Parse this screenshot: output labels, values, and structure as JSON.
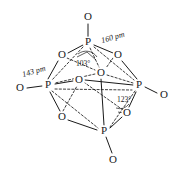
{
  "figure": {
    "caption": ""
  },
  "atoms": {
    "phosphorus": [
      {
        "label": "P",
        "name": "phosphorus-top",
        "x": 88,
        "y": 42
      },
      {
        "label": "P",
        "name": "phosphorus-left",
        "x": 48,
        "y": 85
      },
      {
        "label": "P",
        "name": "phosphorus-right",
        "x": 139,
        "y": 85
      },
      {
        "label": "P",
        "name": "phosphorus-bottom",
        "x": 104,
        "y": 131
      }
    ],
    "terminal_oxygen": [
      {
        "label": "O",
        "name": "oxygen-terminal-top",
        "x": 88,
        "y": 17
      },
      {
        "label": "O",
        "name": "oxygen-terminal-left",
        "x": 20,
        "y": 88
      },
      {
        "label": "O",
        "name": "oxygen-terminal-right",
        "x": 164,
        "y": 95
      },
      {
        "label": "O",
        "name": "oxygen-terminal-bottom",
        "x": 113,
        "y": 160
      }
    ],
    "bridging_oxygen": [
      {
        "label": "O",
        "name": "oxygen-bridge-upper-left",
        "x": 62,
        "y": 55
      },
      {
        "label": "O",
        "name": "oxygen-bridge-upper-right",
        "x": 118,
        "y": 55
      },
      {
        "label": "O",
        "name": "oxygen-bridge-center-back",
        "x": 101,
        "y": 73
      },
      {
        "label": "O",
        "name": "oxygen-bridge-center-left",
        "x": 79,
        "y": 80
      },
      {
        "label": "O",
        "name": "oxygen-bridge-lower-left",
        "x": 62,
        "y": 117
      },
      {
        "label": "O",
        "name": "oxygen-bridge-lower-right",
        "x": 127,
        "y": 113
      }
    ]
  },
  "measurements": {
    "bond_length_terminal": "160 pm",
    "bond_length_bridging": "143 pm",
    "angle_opo": "103°",
    "angle_opo_terminal": "123°"
  },
  "colors": {
    "stroke": "#1a1a1a",
    "background": "#ffffff"
  }
}
